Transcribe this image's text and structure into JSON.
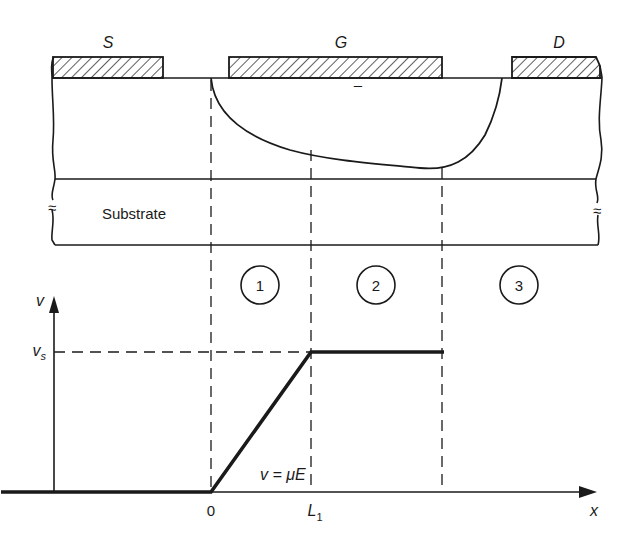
{
  "device": {
    "electrodes": [
      {
        "id": "source",
        "label": "S"
      },
      {
        "id": "gate",
        "label": "G"
      },
      {
        "id": "drain",
        "label": "D"
      }
    ],
    "substrate_label": "Substrate",
    "break_symbol": "≈",
    "gate_mark": "–"
  },
  "regions": [
    {
      "label": "1"
    },
    {
      "label": "2"
    },
    {
      "label": "3"
    }
  ],
  "chart_data": {
    "type": "line",
    "title": "",
    "xlabel": "x",
    "ylabel": "v",
    "x_ticks": [
      {
        "label": "0",
        "value": 0
      },
      {
        "label": "L",
        "sub": "1",
        "value": 1
      }
    ],
    "y_ticks": [
      {
        "label": "v",
        "sub": "s",
        "value": 1
      }
    ],
    "series": [
      {
        "name": "velocity",
        "x": [
          -2.1,
          0,
          1,
          2.33
        ],
        "y": [
          0,
          0,
          1,
          1
        ]
      }
    ],
    "annotations": [
      {
        "text": "v = μE",
        "applies_to": "region 1 (0 ≤ x ≤ L1)"
      }
    ],
    "reference_lines": [
      {
        "axis": "x",
        "value": 0
      },
      {
        "axis": "x",
        "value": 1
      },
      {
        "axis": "x",
        "value": 2.33
      },
      {
        "axis": "y",
        "value": 1
      }
    ],
    "xlim": [
      -2.1,
      4.5
    ],
    "ylim": [
      0,
      1.75
    ],
    "grid": false,
    "legend": "none"
  }
}
